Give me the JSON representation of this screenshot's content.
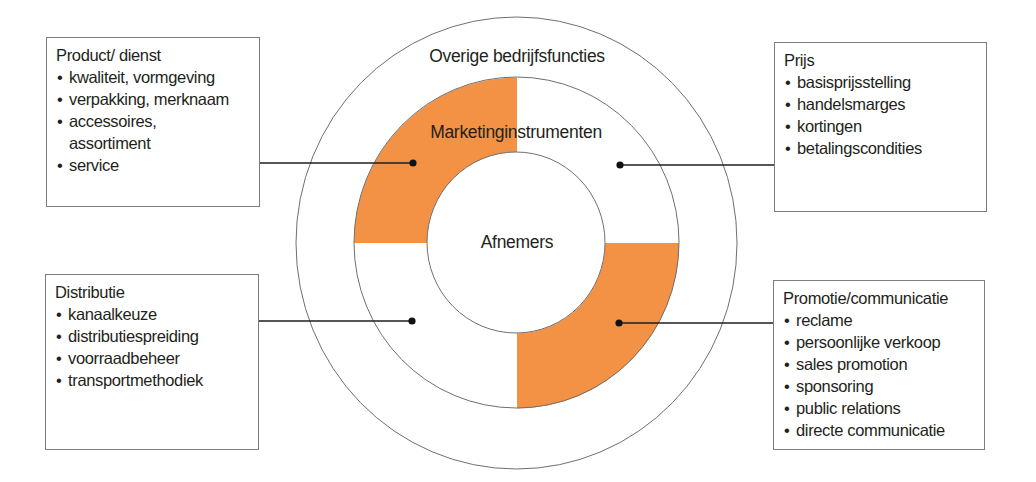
{
  "diagram": {
    "outer_ring_label": "Overige bedrijfsfuncties",
    "middle_ring_label": "Marketinginstrumenten",
    "center_label": "Afnemers",
    "colors": {
      "highlight": "#F39244",
      "stroke": "#6f6f6f",
      "connector": "#1e1e1e",
      "text": "#231f20"
    },
    "quadrants": [
      {
        "position": "top-left",
        "highlighted": true,
        "linked_box": "product"
      },
      {
        "position": "top-right",
        "highlighted": false,
        "linked_box": "prijs"
      },
      {
        "position": "bottom-left",
        "highlighted": false,
        "linked_box": "distributie"
      },
      {
        "position": "bottom-right",
        "highlighted": true,
        "linked_box": "promotie"
      }
    ]
  },
  "boxes": {
    "product": {
      "title": "Product/ dienst",
      "items": [
        "kwaliteit, vormgeving",
        "verpakking, merknaam",
        "accessoires,",
        "service"
      ],
      "continuation": "assortiment"
    },
    "prijs": {
      "title": "Prijs",
      "items": [
        "basisprijsstelling",
        "handelsmarges",
        "kortingen",
        "betalingscondities"
      ]
    },
    "distributie": {
      "title": "Distributie",
      "items": [
        "kanaalkeuze",
        "distributiespreiding",
        "voorraadbeheer",
        "transportmethodiek"
      ]
    },
    "promotie": {
      "title": "Promotie/communicatie",
      "items": [
        "reclame",
        "persoonlijke verkoop",
        "sales promotion",
        "sponsoring",
        "public relations",
        "directe communicatie"
      ]
    }
  },
  "bullet_glyph": "•"
}
